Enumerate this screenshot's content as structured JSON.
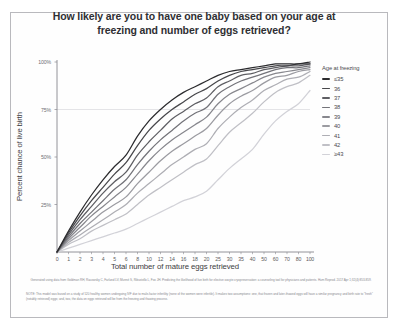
{
  "title": "How likely are you to have one baby based on your age at freezing and number of eggs retrieved?",
  "axes": {
    "y_title": "Percent chance of live birth",
    "x_title": "Total number of mature eggs retrieved",
    "y_ticks": [
      "100%",
      "75%",
      "50%",
      "25%"
    ],
    "x_ticks": [
      "0",
      "1",
      "2",
      "3",
      "4",
      "5",
      "6",
      "8",
      "10",
      "12",
      "14",
      "16",
      "18",
      "20",
      "25",
      "30",
      "35",
      "40",
      "50",
      "60",
      "70",
      "80",
      "100"
    ]
  },
  "legend": {
    "title": "Age at freezing",
    "items": [
      {
        "label": "≤35",
        "color": "#2b2b2e"
      },
      {
        "label": "36",
        "color": "#47474b"
      },
      {
        "label": "37",
        "color": "#5e5e63"
      },
      {
        "label": "38",
        "color": "#737379"
      },
      {
        "label": "39",
        "color": "#87878d"
      },
      {
        "label": "40",
        "color": "#9b9ba1"
      },
      {
        "label": "41",
        "color": "#aeaeb4"
      },
      {
        "label": "42",
        "color": "#c0c0c6"
      },
      {
        "label": "≥43",
        "color": "#d2d2d8"
      }
    ]
  },
  "notes": {
    "citation": "Generated using data from Goldman RH, Racowsky C, Farland LV, Munné S, Ribustello L, Fox JH. Predicting the likelihood of live birth for elective oocyte cryopreservation: a counseling tool for physicians and patients. Hum Reprod. 2017 Apr 1;32(4):853-859.",
    "footnote": "NOTE: This model was based on a study of 520 healthy women undergoing IVF due to male-factor infertility (none of the women were infertile). It makes two assumptions: one, that frozen and later-thawed eggs will have a similar pregnancy and birth rate to \"fresh\" (notably retrieved) eggs; and, two, the data on eggs retrieved will be from the freezing and thawing process."
  },
  "chart_data": {
    "type": "line",
    "title": "How likely are you to have one baby based on your age at freezing and number of eggs retrieved?",
    "xlabel": "Total number of mature eggs retrieved",
    "ylabel": "Percent chance of live birth",
    "ylim": [
      0,
      100
    ],
    "grid": "horizontal-75-only",
    "legend_position": "right",
    "x": [
      0,
      1,
      2,
      3,
      4,
      5,
      6,
      8,
      10,
      12,
      14,
      16,
      18,
      20,
      25,
      30,
      35,
      40,
      50,
      60,
      70,
      80,
      100
    ],
    "series": [
      {
        "name": "≤35",
        "color": "#2b2b2e",
        "values": [
          0,
          11,
          21,
          30,
          38,
          45,
          51,
          61,
          69,
          75,
          80,
          84,
          87,
          90,
          93,
          95,
          96,
          97,
          98,
          99,
          99,
          99,
          100
        ]
      },
      {
        "name": "36",
        "color": "#47474b",
        "values": [
          0,
          10,
          19,
          27,
          34,
          41,
          47,
          56,
          64,
          70,
          75,
          79,
          83,
          86,
          90,
          93,
          95,
          96,
          97,
          98,
          98,
          99,
          99
        ]
      },
      {
        "name": "37",
        "color": "#5e5e63",
        "values": [
          0,
          9,
          17,
          24,
          31,
          37,
          42,
          51,
          58,
          64,
          70,
          74,
          78,
          81,
          87,
          90,
          93,
          94,
          96,
          97,
          98,
          98,
          99
        ]
      },
      {
        "name": "38",
        "color": "#737379",
        "values": [
          0,
          8,
          15,
          21,
          27,
          33,
          38,
          46,
          53,
          59,
          64,
          69,
          73,
          76,
          83,
          87,
          90,
          92,
          94,
          96,
          97,
          97,
          98
        ]
      },
      {
        "name": "39",
        "color": "#87878d",
        "values": [
          0,
          7,
          13,
          19,
          24,
          29,
          34,
          41,
          48,
          54,
          59,
          63,
          67,
          71,
          78,
          83,
          86,
          89,
          92,
          94,
          95,
          96,
          97
        ]
      },
      {
        "name": "40",
        "color": "#9b9ba1",
        "values": [
          0,
          6,
          11,
          16,
          21,
          25,
          29,
          36,
          42,
          48,
          53,
          57,
          61,
          65,
          72,
          78,
          82,
          85,
          89,
          92,
          93,
          95,
          96
        ]
      },
      {
        "name": "41",
        "color": "#aeaeb4",
        "values": [
          0,
          5,
          9,
          13,
          17,
          21,
          25,
          31,
          36,
          41,
          46,
          50,
          54,
          57,
          65,
          71,
          76,
          80,
          85,
          88,
          91,
          92,
          95
        ]
      },
      {
        "name": "42",
        "color": "#c0c0c6",
        "values": [
          0,
          4,
          7,
          11,
          14,
          17,
          20,
          25,
          30,
          34,
          38,
          42,
          46,
          49,
          56,
          63,
          68,
          73,
          79,
          84,
          87,
          89,
          93
        ]
      },
      {
        "name": "≥43",
        "color": "#d2d2d8",
        "values": [
          0,
          2,
          4,
          6,
          8,
          10,
          12,
          15,
          18,
          21,
          24,
          27,
          29,
          32,
          38,
          44,
          49,
          54,
          62,
          69,
          74,
          78,
          85
        ]
      }
    ]
  }
}
